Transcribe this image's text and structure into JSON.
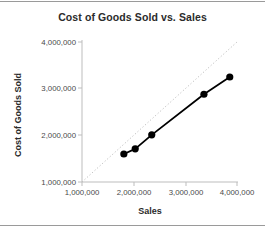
{
  "chart_data": {
    "type": "scatter",
    "title": "Cost of Goods Sold vs. Sales",
    "xlabel": "Sales",
    "ylabel": "Cost of Goods Sold",
    "xlim": [
      1000000,
      4000000
    ],
    "ylim": [
      1000000,
      4000000
    ],
    "grid": false,
    "legend": "none",
    "x_ticks": [
      "1,000,000",
      "2,000,000",
      "3,000,000",
      "4,000,000"
    ],
    "y_ticks": [
      "1,000,000",
      "2,000,000",
      "3,000,000",
      "4,000,000"
    ],
    "x_tick_values": [
      1000000,
      2000000,
      3000000,
      4000000
    ],
    "y_tick_values": [
      1000000,
      2000000,
      3000000,
      4000000
    ],
    "series": [
      {
        "name": "Cost of Goods Sold",
        "marker": "filled-circle",
        "color": "#000000",
        "line": "solid",
        "x": [
          1810000,
          2030000,
          2350000,
          3360000,
          3860000
        ],
        "y": [
          1600000,
          1710000,
          2010000,
          2880000,
          3250000
        ]
      },
      {
        "name": "Reference line (y = x)",
        "marker": "none",
        "color": "#bfbfbf",
        "line": "dotted",
        "x": [
          1000000,
          4000000
        ],
        "y": [
          1000000,
          4000000
        ]
      }
    ],
    "annotations": []
  },
  "colors": {
    "axis": "#bdbdbd",
    "series_line": "#000000",
    "marker": "#000000",
    "reference_line": "#c8c8c8",
    "tick_text": "#4a4a4a",
    "title_text": "#2b2b2b",
    "background": "#ffffff",
    "page_rule": "#9a9a9a"
  }
}
